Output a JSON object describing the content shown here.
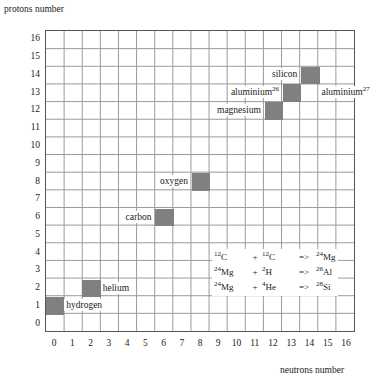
{
  "chart_data": {
    "type": "scatter",
    "title": "",
    "xlabel": "neutrons number",
    "ylabel": "protons number",
    "xlim": [
      0,
      16
    ],
    "ylim": [
      0,
      16
    ],
    "grid": true,
    "legend": "none",
    "x_ticks": [
      "0",
      "1",
      "2",
      "3",
      "4",
      "5",
      "6",
      "7",
      "8",
      "9",
      "10",
      "11",
      "12",
      "13",
      "14",
      "15",
      "16"
    ],
    "y_ticks": [
      "0",
      "1",
      "2",
      "3",
      "4",
      "5",
      "6",
      "7",
      "8",
      "9",
      "10",
      "11",
      "12",
      "13",
      "14",
      "15",
      "16"
    ],
    "cell_color": "#808080",
    "grid_color": "#999999",
    "border_color": "#555555",
    "points": [
      {
        "label": "hydrogen",
        "neutrons": 0,
        "protons": 1,
        "label_side": "right"
      },
      {
        "label": "helium",
        "neutrons": 2,
        "protons": 2,
        "label_side": "right"
      },
      {
        "label": "carbon",
        "neutrons": 6,
        "protons": 6,
        "label_side": "left"
      },
      {
        "label": "oxygen",
        "neutrons": 8,
        "protons": 8,
        "label_side": "left"
      },
      {
        "label": "magnesium",
        "neutrons": 12,
        "protons": 12,
        "label_side": "left"
      },
      {
        "label": "aluminium",
        "superscript": "26",
        "neutrons": 13,
        "protons": 13,
        "label_side": "left"
      },
      {
        "label": "silicon",
        "neutrons": 14,
        "protons": 14,
        "label_side": "left"
      },
      {
        "label": "aluminium",
        "superscript": "27",
        "neutrons": 14,
        "protons": 13,
        "label_side": "right",
        "marker": false
      }
    ],
    "annotations": {
      "equations": [
        {
          "a": "12C",
          "a_sup": "12",
          "a_el": "C",
          "b": "12C",
          "b_sup": "12",
          "b_el": "C",
          "product_sup": "24",
          "product_el": "Mg"
        },
        {
          "a": "24Mg",
          "a_sup": "24",
          "a_el": "Mg",
          "b": "2H",
          "b_sup": "2",
          "b_el": "H",
          "product_sup": "26",
          "product_el": "Al"
        },
        {
          "a": "24Mg",
          "a_sup": "24",
          "a_el": "Mg",
          "b": "4He",
          "b_sup": "4",
          "b_el": "He",
          "product_sup": "28",
          "product_el": "Si"
        }
      ],
      "plus_symbol": "+",
      "arrow_symbol": "=>"
    }
  },
  "axes": {
    "y_title": "protons number",
    "x_title": "neutrons number"
  }
}
